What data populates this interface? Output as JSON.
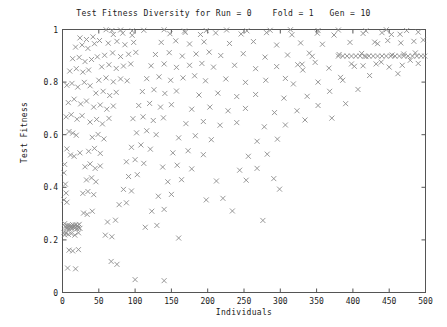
{
  "chart_data": {
    "type": "scatter",
    "title": "Test Fitness Diversity for Run = 0    Fold = 1   Gen = 10",
    "title_parts": {
      "prefix": "Test Fitness Diversity for Run =",
      "run": "0",
      "fold_label": "Fold =",
      "fold": "1",
      "gen_label": "Gen =",
      "gen": "10"
    },
    "xlabel": "Individuals",
    "ylabel": "Test Fitness",
    "xlim": [
      0,
      500
    ],
    "ylim": [
      0,
      1
    ],
    "xticks": [
      0,
      50,
      100,
      150,
      200,
      250,
      300,
      350,
      400,
      450,
      500
    ],
    "xtick_labels": [
      "0",
      "50",
      "100",
      "150",
      "200",
      "250",
      "300",
      "350",
      "400",
      "450",
      "500"
    ],
    "yticks": [
      0,
      0.2,
      0.4,
      0.6,
      0.8,
      1
    ],
    "ytick_labels": [
      "0",
      "0.2",
      "0.4",
      "0.6",
      "0.8",
      "1"
    ],
    "grid": false,
    "legend": false,
    "marker": "x-cross",
    "marker_color": "#8c8c8c",
    "marker_size": 5,
    "frame_color": "#555555",
    "points": [
      [
        3,
        0.262
      ],
      [
        4,
        0.252
      ],
      [
        5,
        0.247
      ],
      [
        6,
        0.243
      ],
      [
        7,
        0.256
      ],
      [
        8,
        0.249
      ],
      [
        9,
        0.241
      ],
      [
        10,
        0.255
      ],
      [
        11,
        0.246
      ],
      [
        12,
        0.251
      ],
      [
        13,
        0.244
      ],
      [
        14,
        0.258
      ],
      [
        15,
        0.248
      ],
      [
        16,
        0.253
      ],
      [
        17,
        0.245
      ],
      [
        18,
        0.257
      ],
      [
        19,
        0.25
      ],
      [
        20,
        0.242
      ],
      [
        21,
        0.254
      ],
      [
        22,
        0.247
      ],
      [
        23,
        0.259
      ],
      [
        24,
        0.244
      ],
      [
        2,
        0.228
      ],
      [
        3,
        0.219
      ],
      [
        5,
        0.226
      ],
      [
        8,
        0.221
      ],
      [
        12,
        0.224
      ],
      [
        17,
        0.218
      ],
      [
        22,
        0.227
      ],
      [
        2,
        0.455
      ],
      [
        3,
        0.487
      ],
      [
        4,
        0.412
      ],
      [
        5,
        0.378
      ],
      [
        6,
        0.343
      ],
      [
        2,
        0.352
      ],
      [
        9,
        0.161
      ],
      [
        14,
        0.158
      ],
      [
        22,
        0.163
      ],
      [
        7,
        0.093
      ],
      [
        18,
        0.09
      ],
      [
        6,
        0.546
      ],
      [
        11,
        0.523
      ],
      [
        16,
        0.518
      ],
      [
        24,
        0.531
      ],
      [
        9,
        0.612
      ],
      [
        14,
        0.606
      ],
      [
        19,
        0.598
      ],
      [
        5,
        0.668
      ],
      [
        12,
        0.676
      ],
      [
        20,
        0.659
      ],
      [
        27,
        0.672
      ],
      [
        8,
        0.722
      ],
      [
        16,
        0.735
      ],
      [
        25,
        0.717
      ],
      [
        33,
        0.728
      ],
      [
        6,
        0.788
      ],
      [
        13,
        0.795
      ],
      [
        21,
        0.781
      ],
      [
        30,
        0.799
      ],
      [
        38,
        0.786
      ],
      [
        10,
        0.842
      ],
      [
        19,
        0.851
      ],
      [
        28,
        0.838
      ],
      [
        36,
        0.846
      ],
      [
        14,
        0.889
      ],
      [
        23,
        0.894
      ],
      [
        31,
        0.878
      ],
      [
        40,
        0.886
      ],
      [
        48,
        0.896
      ],
      [
        18,
        0.933
      ],
      [
        27,
        0.941
      ],
      [
        35,
        0.928
      ],
      [
        44,
        0.946
      ],
      [
        24,
        0.968
      ],
      [
        33,
        0.962
      ],
      [
        42,
        0.972
      ],
      [
        51,
        0.958
      ],
      [
        29,
        0.302
      ],
      [
        34,
        0.297
      ],
      [
        41,
        0.309
      ],
      [
        28,
        0.377
      ],
      [
        35,
        0.384
      ],
      [
        43,
        0.372
      ],
      [
        33,
        0.428
      ],
      [
        40,
        0.436
      ],
      [
        46,
        0.421
      ],
      [
        31,
        0.478
      ],
      [
        38,
        0.489
      ],
      [
        45,
        0.472
      ],
      [
        52,
        0.481
      ],
      [
        36,
        0.537
      ],
      [
        44,
        0.548
      ],
      [
        52,
        0.529
      ],
      [
        41,
        0.59
      ],
      [
        49,
        0.601
      ],
      [
        57,
        0.584
      ],
      [
        38,
        0.648
      ],
      [
        47,
        0.658
      ],
      [
        55,
        0.641
      ],
      [
        64,
        0.662
      ],
      [
        43,
        0.705
      ],
      [
        52,
        0.713
      ],
      [
        61,
        0.697
      ],
      [
        70,
        0.709
      ],
      [
        46,
        0.758
      ],
      [
        56,
        0.765
      ],
      [
        65,
        0.749
      ],
      [
        74,
        0.761
      ],
      [
        50,
        0.807
      ],
      [
        60,
        0.816
      ],
      [
        70,
        0.801
      ],
      [
        80,
        0.812
      ],
      [
        89,
        0.805
      ],
      [
        54,
        0.858
      ],
      [
        64,
        0.866
      ],
      [
        74,
        0.852
      ],
      [
        84,
        0.861
      ],
      [
        94,
        0.869
      ],
      [
        58,
        0.902
      ],
      [
        69,
        0.911
      ],
      [
        80,
        0.897
      ],
      [
        91,
        0.906
      ],
      [
        101,
        0.913
      ],
      [
        63,
        0.948
      ],
      [
        75,
        0.955
      ],
      [
        86,
        0.942
      ],
      [
        98,
        0.951
      ],
      [
        70,
        0.981
      ],
      [
        83,
        0.986
      ],
      [
        96,
        0.978
      ],
      [
        67,
        0.118
      ],
      [
        75,
        0.107
      ],
      [
        59,
        0.218
      ],
      [
        68,
        0.212
      ],
      [
        62,
        0.268
      ],
      [
        73,
        0.275
      ],
      [
        78,
        0.334
      ],
      [
        88,
        0.341
      ],
      [
        84,
        0.392
      ],
      [
        95,
        0.386
      ],
      [
        91,
        0.441
      ],
      [
        103,
        0.448
      ],
      [
        88,
        0.497
      ],
      [
        100,
        0.505
      ],
      [
        112,
        0.491
      ],
      [
        95,
        0.552
      ],
      [
        108,
        0.561
      ],
      [
        121,
        0.545
      ],
      [
        102,
        0.607
      ],
      [
        116,
        0.615
      ],
      [
        129,
        0.6
      ],
      [
        97,
        0.661
      ],
      [
        111,
        0.668
      ],
      [
        125,
        0.654
      ],
      [
        139,
        0.664
      ],
      [
        105,
        0.711
      ],
      [
        120,
        0.719
      ],
      [
        135,
        0.705
      ],
      [
        150,
        0.714
      ],
      [
        110,
        0.764
      ],
      [
        126,
        0.771
      ],
      [
        141,
        0.757
      ],
      [
        157,
        0.766
      ],
      [
        116,
        0.813
      ],
      [
        133,
        0.82
      ],
      [
        149,
        0.807
      ],
      [
        166,
        0.816
      ],
      [
        182,
        0.824
      ],
      [
        122,
        0.862
      ],
      [
        140,
        0.869
      ],
      [
        157,
        0.856
      ],
      [
        175,
        0.864
      ],
      [
        192,
        0.871
      ],
      [
        128,
        0.905
      ],
      [
        147,
        0.912
      ],
      [
        165,
        0.899
      ],
      [
        184,
        0.907
      ],
      [
        202,
        0.914
      ],
      [
        136,
        0.951
      ],
      [
        156,
        0.957
      ],
      [
        175,
        0.945
      ],
      [
        195,
        0.953
      ],
      [
        148,
        0.984
      ],
      [
        169,
        0.989
      ],
      [
        190,
        0.981
      ],
      [
        211,
        0.987
      ],
      [
        114,
        0.248
      ],
      [
        130,
        0.255
      ],
      [
        123,
        0.309
      ],
      [
        140,
        0.316
      ],
      [
        132,
        0.366
      ],
      [
        150,
        0.373
      ],
      [
        145,
        0.421
      ],
      [
        164,
        0.429
      ],
      [
        138,
        0.477
      ],
      [
        158,
        0.484
      ],
      [
        178,
        0.47
      ],
      [
        152,
        0.531
      ],
      [
        173,
        0.539
      ],
      [
        194,
        0.524
      ],
      [
        160,
        0.588
      ],
      [
        183,
        0.596
      ],
      [
        205,
        0.581
      ],
      [
        170,
        0.642
      ],
      [
        194,
        0.65
      ],
      [
        217,
        0.636
      ],
      [
        240,
        0.646
      ],
      [
        178,
        0.697
      ],
      [
        203,
        0.705
      ],
      [
        228,
        0.691
      ],
      [
        252,
        0.7
      ],
      [
        188,
        0.751
      ],
      [
        214,
        0.758
      ],
      [
        240,
        0.745
      ],
      [
        266,
        0.753
      ],
      [
        197,
        0.805
      ],
      [
        225,
        0.812
      ],
      [
        252,
        0.799
      ],
      [
        280,
        0.807
      ],
      [
        307,
        0.814
      ],
      [
        208,
        0.857
      ],
      [
        237,
        0.864
      ],
      [
        266,
        0.851
      ],
      [
        295,
        0.859
      ],
      [
        324,
        0.866
      ],
      [
        218,
        0.901
      ],
      [
        249,
        0.908
      ],
      [
        279,
        0.895
      ],
      [
        310,
        0.903
      ],
      [
        340,
        0.91
      ],
      [
        230,
        0.947
      ],
      [
        263,
        0.954
      ],
      [
        295,
        0.941
      ],
      [
        328,
        0.949
      ],
      [
        246,
        0.983
      ],
      [
        281,
        0.988
      ],
      [
        316,
        0.98
      ],
      [
        351,
        0.986
      ],
      [
        212,
        0.424
      ],
      [
        234,
        0.31
      ],
      [
        198,
        0.352
      ],
      [
        221,
        0.358
      ],
      [
        244,
        0.465
      ],
      [
        268,
        0.472
      ],
      [
        256,
        0.518
      ],
      [
        282,
        0.526
      ],
      [
        268,
        0.575
      ],
      [
        296,
        0.583
      ],
      [
        278,
        0.63
      ],
      [
        307,
        0.637
      ],
      [
        292,
        0.684
      ],
      [
        323,
        0.691
      ],
      [
        305,
        0.739
      ],
      [
        337,
        0.746
      ],
      [
        318,
        0.793
      ],
      [
        352,
        0.8
      ],
      [
        386,
        0.807
      ],
      [
        331,
        0.846
      ],
      [
        367,
        0.853
      ],
      [
        402,
        0.86
      ],
      [
        344,
        0.898
      ],
      [
        381,
        0.905
      ],
      [
        418,
        0.897
      ],
      [
        358,
        0.944
      ],
      [
        396,
        0.951
      ],
      [
        434,
        0.946
      ],
      [
        374,
        0.979
      ],
      [
        414,
        0.985
      ],
      [
        453,
        0.981
      ],
      [
        299,
        0.393
      ],
      [
        334,
        0.656
      ],
      [
        371,
        0.663
      ],
      [
        352,
        0.711
      ],
      [
        390,
        0.718
      ],
      [
        368,
        0.765
      ],
      [
        407,
        0.772
      ],
      [
        383,
        0.818
      ],
      [
        423,
        0.825
      ],
      [
        462,
        0.832
      ],
      [
        398,
        0.869
      ],
      [
        439,
        0.876
      ],
      [
        479,
        0.883
      ],
      [
        412,
        0.909
      ],
      [
        454,
        0.903
      ],
      [
        470,
        0.907
      ],
      [
        486,
        0.911
      ],
      [
        380,
        0.899
      ],
      [
        386,
        0.899
      ],
      [
        392,
        0.899
      ],
      [
        398,
        0.899
      ],
      [
        404,
        0.899
      ],
      [
        410,
        0.899
      ],
      [
        416,
        0.899
      ],
      [
        422,
        0.899
      ],
      [
        428,
        0.899
      ],
      [
        434,
        0.899
      ],
      [
        440,
        0.899
      ],
      [
        446,
        0.899
      ],
      [
        452,
        0.899
      ],
      [
        458,
        0.899
      ],
      [
        464,
        0.899
      ],
      [
        470,
        0.899
      ],
      [
        476,
        0.899
      ],
      [
        482,
        0.899
      ],
      [
        488,
        0.899
      ],
      [
        494,
        0.899
      ],
      [
        499,
        0.899
      ],
      [
        430,
        0.952
      ],
      [
        448,
        0.958
      ],
      [
        466,
        0.949
      ],
      [
        484,
        0.955
      ],
      [
        497,
        0.96
      ],
      [
        440,
        0.988
      ],
      [
        465,
        0.982
      ],
      [
        490,
        0.99
      ],
      [
        414,
        0.862
      ],
      [
        432,
        0.869
      ],
      [
        450,
        0.857
      ],
      [
        468,
        0.864
      ],
      [
        490,
        0.871
      ],
      [
        330,
        0.868
      ],
      [
        348,
        0.875
      ],
      [
        253,
        0.427
      ],
      [
        291,
        0.433
      ],
      [
        276,
        0.274
      ],
      [
        160,
        0.207
      ],
      [
        100,
        0.049
      ],
      [
        140,
        0.045
      ],
      [
        198,
        0.996
      ],
      [
        226,
        0.998
      ],
      [
        254,
        0.995
      ],
      [
        112,
        0.997
      ],
      [
        140,
        0.999
      ],
      [
        168,
        0.994
      ],
      [
        286,
        0.997
      ],
      [
        314,
        0.999
      ],
      [
        352,
        0.996
      ],
      [
        380,
        0.998
      ],
      [
        418,
        0.995
      ],
      [
        446,
        0.999
      ],
      [
        474,
        0.996
      ],
      [
        80,
        0.998
      ],
      [
        96,
        0.995
      ],
      [
        60,
        0.999
      ],
      [
        68,
        0.996
      ]
    ]
  }
}
